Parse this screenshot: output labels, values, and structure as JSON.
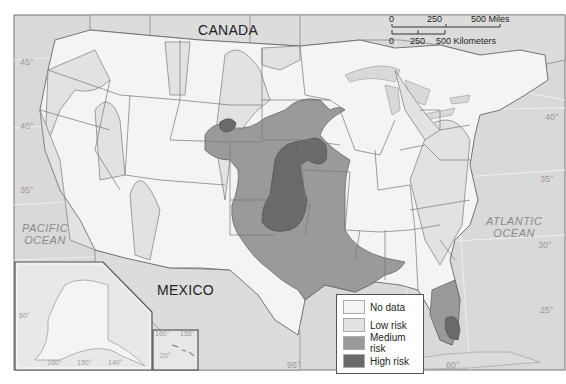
{
  "map": {
    "title": "",
    "labels": {
      "canada": "CANADA",
      "mexico": "MEXICO",
      "pacific_ocean": [
        "PACIFIC",
        "OCEAN"
      ],
      "atlantic_ocean": [
        "ATLANTIC",
        "OCEAN"
      ]
    },
    "latitude_labels_left": [
      "45°",
      "40°",
      "35°"
    ],
    "latitude_labels_right": [
      "40°",
      "35°",
      "30°",
      "25°"
    ],
    "longitude_labels": [
      "95°",
      "85°",
      "80°"
    ],
    "alaska_inset_labels": [
      "160°",
      "150°",
      "140°",
      "60°"
    ],
    "hawaii_inset_labels": [
      "160°",
      "155°",
      "20°"
    ],
    "scale_bar": {
      "miles": {
        "ticks": [
          "0",
          "250",
          "500 Miles"
        ]
      },
      "kilometers": {
        "ticks": [
          "0",
          "250",
          "500 Kilometers"
        ]
      }
    },
    "legend": {
      "items": [
        {
          "label": "No data",
          "color": "#f4f4f4"
        },
        {
          "label": "Low risk",
          "color": "#e2e2e2"
        },
        {
          "label": "Medium risk",
          "color": "#9a9a9a"
        },
        {
          "label": "High risk",
          "color": "#6a6a6a"
        }
      ]
    },
    "colors": {
      "water": "#d9d9d9",
      "foreign_land": "#dcdcdc",
      "no_data": "#f4f4f4",
      "low_risk": "#e2e2e2",
      "medium_risk": "#9a9a9a",
      "high_risk": "#6a6a6a",
      "border": "#777777"
    }
  }
}
